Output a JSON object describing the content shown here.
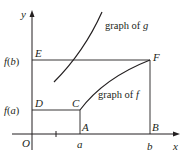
{
  "diagram": {
    "axes": {
      "x_label": "x",
      "y_label": "y",
      "origin_label": "O"
    },
    "points": {
      "A": "A",
      "B": "B",
      "C": "C",
      "D": "D",
      "E": "E",
      "F": "F"
    },
    "x_ticks": {
      "a": "a",
      "b": "b"
    },
    "y_ticks": {
      "fa_f": "f",
      "fa_open": "(",
      "fa_arg": "a",
      "fa_close": ")",
      "fb_f": "f",
      "fb_open": "(",
      "fb_arg": "b",
      "fb_close": ")"
    },
    "curve_labels": {
      "g_text": "graph of ",
      "g_var": "g",
      "f_text": "graph of ",
      "f_var": "f"
    },
    "colors": {
      "stroke": "#231f20",
      "background": "#ffffff"
    }
  }
}
